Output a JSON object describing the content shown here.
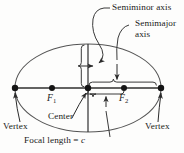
{
  "figure": {
    "type": "geometry-diagram",
    "stroke_color": "#3b3b3b",
    "text_color": "#1a1a1a",
    "background_color": "#fdfdfc"
  },
  "labels": {
    "semiminor_axis": "Semiminor axis",
    "semimajor_axis_line1": "Semimajor",
    "semimajor_axis_line2": "axis",
    "focus_1": "F",
    "focus_1_sub": "1",
    "focus_2": "F",
    "focus_2_sub": "2",
    "vertex_left": "Vertex",
    "vertex_right": "Vertex",
    "center": "Center",
    "focal_length": "Focal length = ",
    "focal_length_var": "c"
  },
  "geometry": {
    "ellipse_center_x": 88,
    "ellipse_center_y": 88,
    "semimajor_px": 73,
    "semiminor_px": 44,
    "vertex_left_x": 15,
    "vertex_right_x": 161,
    "focus_1_x": 52,
    "focus_2_x": 124,
    "axis_y": 88,
    "minor_axis_top_y": 44,
    "minor_axis_bottom_y": 132
  }
}
